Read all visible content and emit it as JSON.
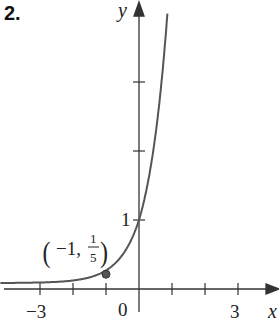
{
  "problem_number": "2.",
  "chart_data": {
    "type": "line",
    "title": "",
    "function": "y = 5^x",
    "xlabel": "x",
    "ylabel": "y",
    "xlim": [
      -4.2,
      4.1
    ],
    "ylim": [
      -0.45,
      4.0
    ],
    "x_ticks": [
      -3,
      -2,
      -1,
      1,
      2,
      3
    ],
    "x_tick_labels": {
      "-3": "−3",
      "0": "0",
      "3": "3"
    },
    "y_ticks": [
      1,
      2,
      3
    ],
    "y_tick_labels": {
      "1": "1"
    },
    "grid": false,
    "legend": null,
    "annotations": [
      {
        "point": [
          -1,
          0.2
        ],
        "label_main": "−1,",
        "label_num": "1",
        "label_den": "5",
        "marker": "dot"
      }
    ],
    "asymptote": {
      "y": 0,
      "note": "horizontal asymptote y=0"
    },
    "series": [
      {
        "name": "5^x",
        "x": [
          -4.2,
          -3,
          -2,
          -1,
          -0.5,
          0,
          0.5,
          0.86
        ],
        "values": [
          0.0012,
          0.008,
          0.04,
          0.2,
          0.447,
          1,
          2.236,
          4.0
        ]
      }
    ]
  }
}
